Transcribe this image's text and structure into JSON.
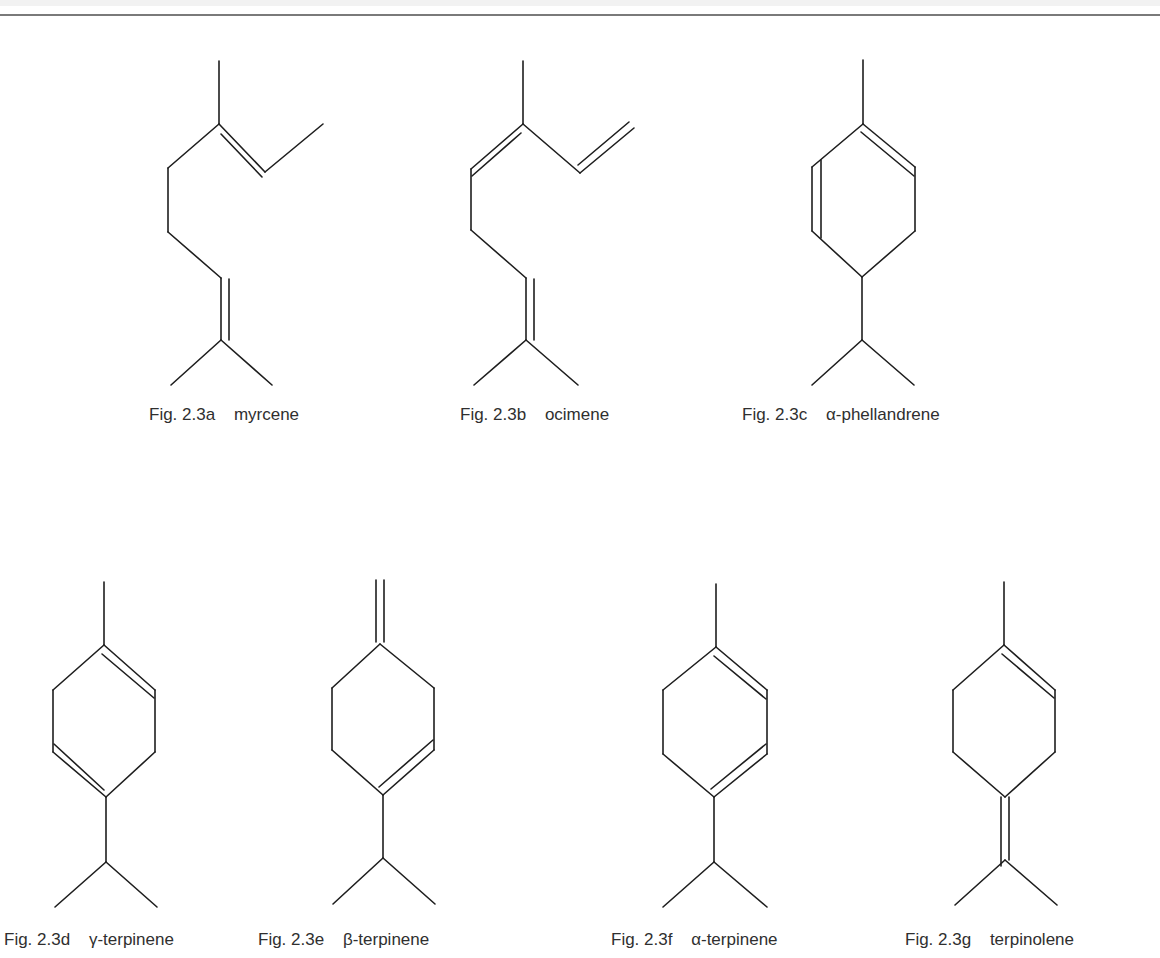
{
  "figure_group": "Fig. 2.3",
  "molecules": [
    {
      "id": "a",
      "fig": "Fig. 2.3a",
      "name": "myrcene",
      "type": "acyclic monoterpene"
    },
    {
      "id": "b",
      "fig": "Fig. 2.3b",
      "name": "ocimene",
      "type": "acyclic monoterpene"
    },
    {
      "id": "c",
      "fig": "Fig. 2.3c",
      "name": "α-phellandrene",
      "type": "monocyclic monoterpene"
    },
    {
      "id": "d",
      "fig": "Fig. 2.3d",
      "name": "γ-terpinene",
      "type": "monocyclic monoterpene"
    },
    {
      "id": "e",
      "fig": "Fig. 2.3e",
      "name": "β-terpinene",
      "type": "monocyclic monoterpene"
    },
    {
      "id": "f",
      "fig": "Fig. 2.3f",
      "name": "α-terpinene",
      "type": "monocyclic monoterpene"
    },
    {
      "id": "g",
      "fig": "Fig. 2.3g",
      "name": "terpinolene",
      "type": "monocyclic monoterpene"
    }
  ],
  "colors": {
    "line": "#1e1e1e",
    "text": "#2f2f2f",
    "rule": "#7a7a7a",
    "background": "#ffffff"
  }
}
